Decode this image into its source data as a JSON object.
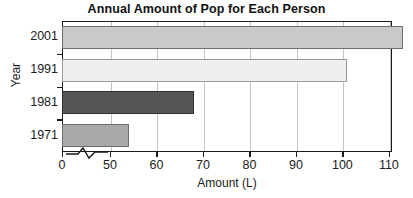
{
  "chart_data": {
    "type": "bar",
    "orientation": "horizontal",
    "title": "Annual Amount of Pop for Each Person",
    "xlabel": "Amount (L)",
    "ylabel": "Year",
    "categories": [
      "2001",
      "1991",
      "1981",
      "1971"
    ],
    "values": [
      113,
      101,
      68,
      54
    ],
    "bar_colors": [
      "#c9c9c9",
      "#efefef",
      "#565656",
      "#a9a9a9"
    ],
    "bar_border_colors": [
      "#6e6e6e",
      "#9a9a9a",
      "#2f2f2f",
      "#6e6e6e"
    ],
    "xlim": [
      0,
      120
    ],
    "x_axis_broken": true,
    "x_break_between": [
      0,
      50
    ],
    "xticks": [
      0,
      50,
      60,
      70,
      80,
      90,
      100,
      110,
      120
    ],
    "xtick_labels": [
      "0",
      "50",
      "60",
      "70",
      "80",
      "90",
      "100",
      "110",
      "120"
    ],
    "grid": "vertical",
    "gridline_color": "#c4c4c4",
    "legend": null,
    "frame_color": "#1a1a1a",
    "background": "#ffffff"
  },
  "axis": {
    "x_title": "Amount (L)",
    "y_title": "Year"
  },
  "header": {
    "title": "Annual Amount of Pop for Each Person"
  }
}
